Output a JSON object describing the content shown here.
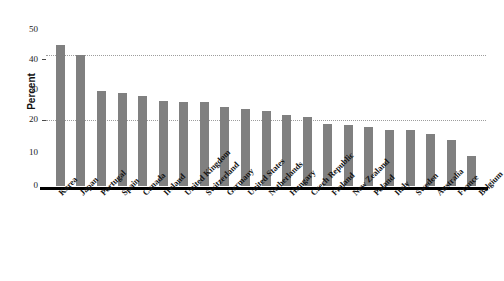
{
  "chart_data": {
    "type": "bar",
    "title": "",
    "xlabel": "",
    "ylabel": "Percent",
    "ylim": [
      0,
      50
    ],
    "yticks": [
      0,
      10,
      20,
      30,
      40,
      50
    ],
    "grid": "horizontal dotted gridlines at 20 and 40",
    "legend": "none",
    "orientation": "vertical",
    "bar_color": "#808080",
    "categories": [
      "Korea",
      "Japan",
      "Portugal",
      "Spain",
      "Canada",
      "Ireland",
      "United Kingdom",
      "Switzerland",
      "Germany",
      "United States",
      "Netherlands",
      "Hungary",
      "Czech Republic",
      "Finland",
      "New Zealand",
      "Poland",
      "Italy",
      "Sweden",
      "Australia",
      "France",
      "Belgium"
    ],
    "values": [
      43,
      40,
      29,
      28.5,
      27.5,
      26,
      25.5,
      25.5,
      24,
      23.5,
      23,
      21.5,
      21,
      19,
      18.5,
      18,
      17,
      17,
      16,
      14,
      9
    ]
  },
  "axes": {
    "y_tick_labels": [
      "50",
      "40",
      "30",
      "20",
      "10",
      "0"
    ],
    "y_axis_title": "Percent"
  },
  "title_fragment": ""
}
